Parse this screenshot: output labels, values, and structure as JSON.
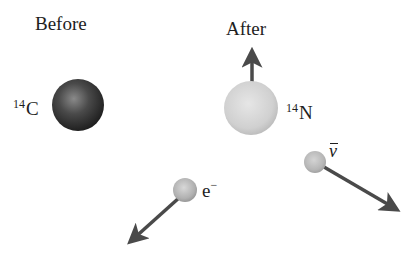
{
  "diagram": {
    "type": "beta-decay-illustration",
    "panels": {
      "before": {
        "title": "Before",
        "nucleus": {
          "mass_number": "14",
          "symbol": "C",
          "color": "#3a3a3a",
          "center": [
            78,
            105
          ],
          "radius": 26
        }
      },
      "after": {
        "title": "After",
        "nucleus": {
          "mass_number": "14",
          "symbol": "N",
          "color": "#d2d2d2",
          "center": [
            251,
            108
          ],
          "radius": 27,
          "momentum_arrow": {
            "from": [
              252,
              82
            ],
            "to": [
              252,
              48
            ],
            "direction": "up"
          }
        },
        "electron": {
          "symbol": "e",
          "charge": "−",
          "color": "#b8b8b8",
          "center": [
            185,
            190
          ],
          "radius": 12,
          "momentum_arrow": {
            "from": [
              179,
              198
            ],
            "to": [
              125,
              246
            ],
            "direction": "down-left"
          }
        },
        "antineutrino": {
          "symbol": "ν",
          "has_bar": true,
          "color": "#bdbdbd",
          "center": [
            315,
            162
          ],
          "radius": 11,
          "momentum_arrow": {
            "from": [
              325,
              168
            ],
            "to": [
              402,
              213
            ],
            "direction": "down-right"
          }
        }
      }
    },
    "arrow_color": "#4a4a4a"
  }
}
